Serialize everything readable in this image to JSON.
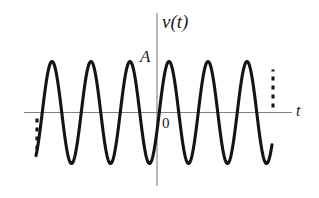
{
  "figure": {
    "background_color": "#ffffff",
    "wave_color": "#141414",
    "axis_color": "#808080",
    "label_color": "#1a1a1a"
  },
  "labels": {
    "y_axis": "v(t)",
    "amplitude": "A",
    "origin": "0",
    "x_axis": "t"
  },
  "chart_data": {
    "type": "line",
    "title": "",
    "subtitle": "",
    "xlabel": "t",
    "ylabel": "v(t)",
    "grid": false,
    "legend": null,
    "annotations": [
      {
        "text": "A",
        "meaning": "amplitude-level-marker",
        "x_px": 148,
        "y_px": 58
      },
      {
        "text": "0",
        "meaning": "origin-label",
        "x_px": 166,
        "y_px": 122
      },
      {
        "text": "v(t)",
        "meaning": "vertical-axis-label",
        "x_px": 180,
        "y_px": 22
      },
      {
        "text": "t",
        "meaning": "horizontal-axis-label",
        "x_px": 299,
        "y_px": 111
      }
    ],
    "waveform": {
      "function": "A*cos(2*pi*t/T)",
      "amplitude_px": 51,
      "period_px": 39,
      "peak_y_px": 62,
      "trough_y_px": 164,
      "baseline_y_px": 112.5,
      "peak_count_visible": 6,
      "trough_count_visible": 6,
      "peak_x_px": [
        52,
        91,
        130,
        169,
        208,
        247
      ],
      "trough_x_px": [
        71,
        110,
        149,
        188,
        227,
        266
      ],
      "start_x_px": 36,
      "end_x_px": 272,
      "continuation_left": "dashed",
      "continuation_right": "dashed"
    },
    "axes": {
      "x_axis_y_px": 112.5,
      "x_axis_start_px": 24,
      "x_axis_end_px": 292,
      "y_axis_x_px": 157,
      "y_axis_top_px": 13,
      "y_axis_bottom_px": 186
    },
    "series": [
      {
        "name": "v(t)",
        "color": "#141414",
        "x": [
          -3.1,
          -3.0,
          -2.9,
          -2.8,
          -2.7,
          -2.6,
          -2.5,
          -2.4,
          -2.3,
          -2.2,
          -2.1,
          -2.0,
          -1.9,
          -1.8,
          -1.7,
          -1.6,
          -1.5,
          -1.4,
          -1.3,
          -1.2,
          -1.1,
          -1.0,
          -0.9,
          -0.8,
          -0.7,
          -0.6,
          -0.5,
          -0.4,
          -0.3,
          -0.2,
          -0.1,
          0.0,
          0.1,
          0.2,
          0.3,
          0.4,
          0.5,
          0.6,
          0.7,
          0.8,
          0.9,
          1.0,
          1.1,
          1.2,
          1.3,
          1.4,
          1.5,
          1.6,
          1.7,
          1.8,
          1.9,
          2.0,
          2.1,
          2.2,
          2.3,
          2.4,
          2.5,
          2.6,
          2.7,
          2.8,
          2.9,
          3.0
        ],
        "y": [
          0.59,
          1.0,
          0.59,
          -0.31,
          -0.95,
          -0.95,
          -0.31,
          0.59,
          1.0,
          0.59,
          -0.31,
          -0.95,
          -0.95,
          -0.31,
          0.59,
          1.0,
          0.59,
          -0.31,
          -0.95,
          -0.95,
          -0.31,
          0.59,
          1.0,
          0.59,
          -0.31,
          -0.95,
          -0.95,
          -0.31,
          0.59,
          1.0,
          0.95,
          0.81,
          0.59,
          -0.31,
          -0.95,
          -0.95,
          -0.31,
          0.59,
          1.0,
          0.59,
          -0.31,
          -0.95,
          -0.95,
          -0.31,
          0.59,
          1.0,
          0.59,
          -0.31,
          -0.95,
          -0.95,
          -0.31,
          0.59,
          1.0,
          0.59,
          -0.31,
          -0.95,
          -0.95,
          -0.31,
          0.59,
          1.0,
          0.59,
          -0.31
        ]
      }
    ],
    "xlim": [
      -3.2,
      3.2
    ],
    "ylim": [
      -1.1,
      1.1
    ]
  }
}
